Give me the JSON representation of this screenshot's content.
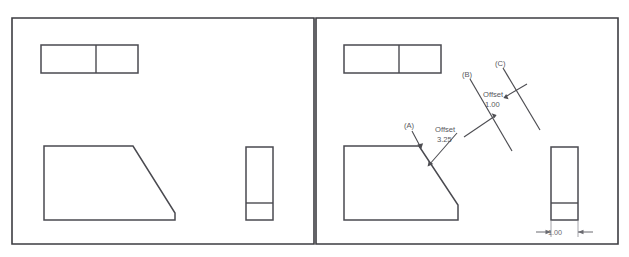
{
  "document": {
    "title": "Chamfer / Offset Comparison Drawing",
    "panels": [
      {
        "id": "left-panel",
        "name": "before-state",
        "caption": "",
        "shapes": [
          {
            "name": "top-split-rectangle",
            "type": "rectangle-with-vertical-divider"
          },
          {
            "name": "chamfered-block-profile",
            "type": "polygon-chamfered"
          },
          {
            "name": "tall-side-rectangle",
            "type": "rectangle-with-horizontal-divider"
          }
        ]
      },
      {
        "id": "right-panel",
        "name": "after-state",
        "caption": "",
        "shapes": [
          {
            "name": "top-split-rectangle",
            "type": "rectangle-with-vertical-divider"
          },
          {
            "name": "chamfered-block-profile",
            "type": "polygon-chamfered"
          },
          {
            "name": "tall-side-rectangle",
            "type": "rectangle-with-horizontal-divider"
          }
        ]
      }
    ]
  },
  "annotations": {
    "label_a": "(A)",
    "label_b": "(B)",
    "label_c": "(C)",
    "offset_a_word": "Offset",
    "offset_a_value": "3.25",
    "offset_b_word": "Offset",
    "offset_b_value": "1.00"
  },
  "dimensions": {
    "width_dim_value": "1.00"
  },
  "colors": {
    "frame_stroke": "#3d3d42",
    "part_stroke": "#4a4a50",
    "annotation_text": "#58585e",
    "dimension_text": "#6a6a70",
    "background": "#ffffff"
  }
}
